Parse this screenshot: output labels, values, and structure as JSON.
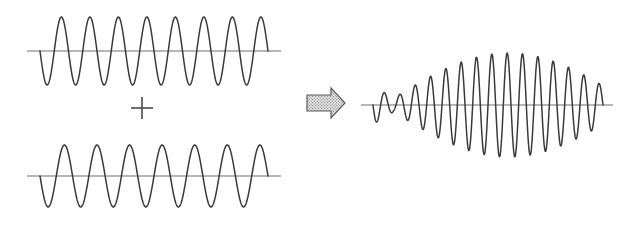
{
  "figure": {
    "background_color": "#ffffff",
    "stroke_color": "#3a3a3a",
    "axis_color": "#6e6e6e",
    "operator_symbol": "+",
    "arrow_symbol": "right-block-arrow",
    "arrow_fill_color": "#d8d8d8",
    "arrow_outline_color": "#5a5a5a"
  },
  "panels": [
    {
      "id": "wave-1",
      "name": "first-input-wave",
      "role": "input",
      "axis": {
        "x_start": 27,
        "x_end": 281,
        "y": 51
      },
      "label": ""
    },
    {
      "id": "wave-2",
      "name": "second-input-wave",
      "role": "input",
      "axis": {
        "x_start": 27,
        "x_end": 281,
        "y": 176
      },
      "label": ""
    },
    {
      "id": "wave-sum",
      "name": "resultant-beat-wave",
      "role": "output",
      "axis": {
        "x_start": 361,
        "x_end": 613,
        "y": 105
      },
      "label": ""
    }
  ],
  "chart_data": {
    "type": "line",
    "xlabel": "",
    "ylabel": "",
    "grid": false,
    "legend": null,
    "annotations": [
      {
        "text": "+",
        "x": 142,
        "y": 108,
        "name": "plus-operator"
      },
      {
        "text": "⇒",
        "x": 322,
        "y": 103,
        "name": "implies-arrow"
      }
    ],
    "series": [
      {
        "name": "wave-1",
        "description": "Sinusoid, 8 cycles, constant amplitude",
        "waveform": "sine",
        "cycles": 8,
        "amplitude": 34,
        "phase_deg": 180,
        "x_domain": [
          40,
          268
        ],
        "baseline_y": 51,
        "xlim": [
          27,
          281
        ],
        "ylim": [
          17,
          85
        ]
      },
      {
        "name": "wave-2",
        "description": "Sinusoid, 7 cycles, constant amplitude",
        "waveform": "sine",
        "cycles": 7,
        "amplitude": 31,
        "phase_deg": 180,
        "x_domain": [
          40,
          268
        ],
        "baseline_y": 176,
        "xlim": [
          27,
          281
        ],
        "ylim": [
          145,
          207
        ]
      },
      {
        "name": "wave-sum",
        "description": "Sum of wave-1 and wave-2 showing two beat envelopes with a node in the middle",
        "waveform": "beat",
        "carrier_cycles": 15,
        "envelope_cycles": 1,
        "amplitude": 52,
        "phase_deg": 180,
        "x_domain": [
          373,
          603
        ],
        "baseline_y": 105,
        "xlim": [
          361,
          613
        ],
        "ylim": [
          52,
          158
        ],
        "beat_maxima_x": [
          415,
          545
        ],
        "beat_node_x": [
          480
        ]
      }
    ]
  }
}
